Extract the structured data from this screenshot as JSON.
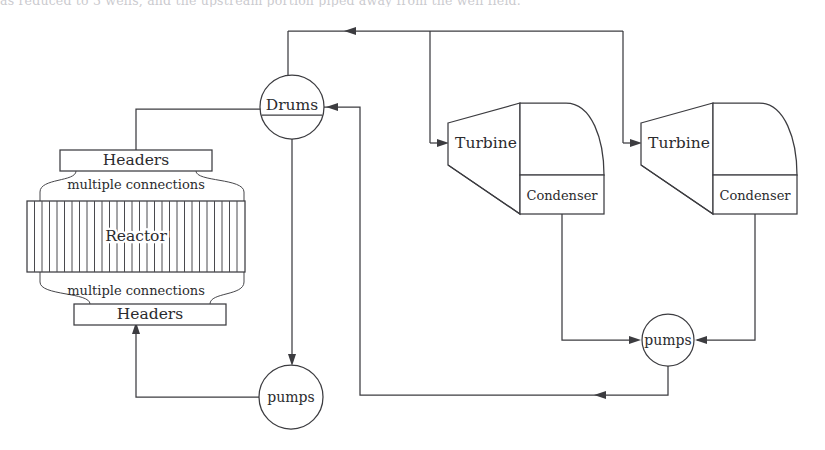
{
  "page": {
    "top_cropped_text": "as reduced to 3 wells, and the upstream portion piped away from the well field."
  },
  "diagram": {
    "type": "process-flow-diagram",
    "stroke_color": "#3c3c40",
    "background_color": "#ffffff",
    "nodes": [
      {
        "id": "reactor",
        "label": "Reactor",
        "shape": "tube-bundle-box",
        "x": 136,
        "y": 237
      },
      {
        "id": "header-top",
        "label": "Headers",
        "shape": "rect",
        "x": 136,
        "y": 160
      },
      {
        "id": "header-bottom",
        "label": "Headers",
        "shape": "rect",
        "x": 136,
        "y": 314
      },
      {
        "id": "conn-top",
        "label": "multiple connections",
        "shape": "text",
        "x": 136,
        "y": 184
      },
      {
        "id": "conn-bottom",
        "label": "multiple connections",
        "shape": "text",
        "x": 136,
        "y": 290
      },
      {
        "id": "drums",
        "label": "Drums",
        "shape": "circle",
        "x": 292,
        "y": 107
      },
      {
        "id": "pumps-left",
        "label": "pumps",
        "shape": "circle",
        "x": 291,
        "y": 397
      },
      {
        "id": "turbine-1",
        "label": "Turbine",
        "shape": "turbine",
        "x": 486,
        "y": 143
      },
      {
        "id": "condenser-1",
        "label": "Condenser",
        "shape": "rect",
        "x": 562,
        "y": 195
      },
      {
        "id": "turbine-2",
        "label": "Turbine",
        "shape": "turbine",
        "x": 679,
        "y": 143
      },
      {
        "id": "condenser-2",
        "label": "Condenser",
        "shape": "rect",
        "x": 755,
        "y": 195
      },
      {
        "id": "pumps-right",
        "label": "pumps",
        "shape": "circle",
        "x": 668,
        "y": 340
      }
    ],
    "flows": [
      {
        "from": "drums",
        "to": "turbine-1",
        "arrow": true
      },
      {
        "from": "drums",
        "to": "turbine-2",
        "arrow": true
      },
      {
        "from": "header-top",
        "to": "drums",
        "arrow": false
      },
      {
        "from": "drums",
        "to": "pumps-left",
        "arrow": true
      },
      {
        "from": "pumps-left",
        "to": "header-bottom",
        "arrow": true
      },
      {
        "from": "turbine-1",
        "to": "condenser-1",
        "arrow": false
      },
      {
        "from": "turbine-2",
        "to": "condenser-2",
        "arrow": false
      },
      {
        "from": "condenser-1",
        "to": "pumps-right",
        "arrow": true
      },
      {
        "from": "condenser-2",
        "to": "pumps-right",
        "arrow": true
      },
      {
        "from": "pumps-right",
        "to": "drums",
        "arrow": true
      }
    ]
  }
}
